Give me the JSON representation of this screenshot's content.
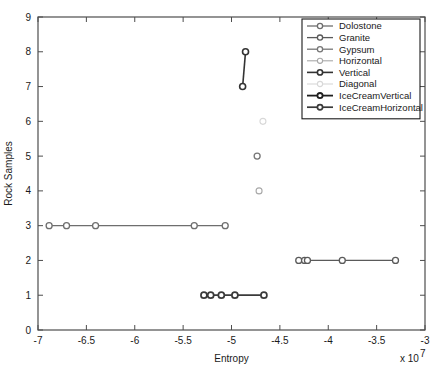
{
  "chart_data": {
    "type": "scatter",
    "title": "",
    "xlabel": "Entropy",
    "ylabel": "Rock Samples",
    "x_exponent_label": "x 10",
    "x_exponent_value": "7",
    "xlim": [
      -7,
      -3
    ],
    "ylim": [
      0,
      9
    ],
    "xticks": [
      -7,
      -6.5,
      -6,
      -5.5,
      -5,
      -4.5,
      -4,
      -3.5,
      -3
    ],
    "xticklabels": [
      "-7",
      "-6.5",
      "-6",
      "-5.5",
      "-5",
      "-4.5",
      "-4",
      "-3.5",
      "-3"
    ],
    "yticks": [
      0,
      1,
      2,
      3,
      4,
      5,
      6,
      7,
      8,
      9
    ],
    "yticklabels": [
      "0",
      "1",
      "2",
      "3",
      "4",
      "5",
      "6",
      "7",
      "8",
      "9"
    ],
    "grid": false,
    "legend_position": "upper-right",
    "series": [
      {
        "name": "Dolostone",
        "color": "#6e6e6e",
        "linewidth": 1.3,
        "marker": "o",
        "points": [
          {
            "x": -6.885,
            "y": 3
          },
          {
            "x": -6.705,
            "y": 3
          },
          {
            "x": -6.405,
            "y": 3
          },
          {
            "x": -5.385,
            "y": 3
          },
          {
            "x": -5.065,
            "y": 3
          }
        ]
      },
      {
        "name": "Granite",
        "color": "#5a5a5a",
        "linewidth": 1.3,
        "marker": "o",
        "points": [
          {
            "x": -4.305,
            "y": 2
          },
          {
            "x": -4.245,
            "y": 2
          },
          {
            "x": -4.215,
            "y": 2
          },
          {
            "x": -3.855,
            "y": 2
          },
          {
            "x": -3.305,
            "y": 2
          }
        ]
      },
      {
        "name": "Gypsum",
        "color": "#767676",
        "linewidth": 1.3,
        "marker": "o",
        "points": [
          {
            "x": -4.735,
            "y": 5
          }
        ]
      },
      {
        "name": "Horizontal",
        "color": "#a8a8a8",
        "linewidth": 1.1,
        "marker": "o",
        "points": [
          {
            "x": -4.715,
            "y": 4
          }
        ]
      },
      {
        "name": "Vertical",
        "color": "#333333",
        "linewidth": 1.6,
        "marker": "o",
        "points": [
          {
            "x": -4.855,
            "y": 8
          },
          {
            "x": -4.885,
            "y": 7
          }
        ]
      },
      {
        "name": "Diagonal",
        "color": "#d8d8d8",
        "linewidth": 1.1,
        "marker": "o",
        "points": [
          {
            "x": -4.675,
            "y": 6
          }
        ]
      },
      {
        "name": "IceCreamVertical",
        "color": "#1f1f1f",
        "linewidth": 1.8,
        "marker": "o",
        "points": []
      },
      {
        "name": "IceCreamHorizontal",
        "color": "#3a3a3a",
        "linewidth": 1.7,
        "marker": "o",
        "points": [
          {
            "x": -5.285,
            "y": 1
          },
          {
            "x": -5.215,
            "y": 1
          },
          {
            "x": -5.105,
            "y": 1
          },
          {
            "x": -4.965,
            "y": 1
          },
          {
            "x": -4.665,
            "y": 1
          }
        ]
      }
    ]
  },
  "legend": {
    "entries": [
      {
        "label": "Dolostone"
      },
      {
        "label": "Granite"
      },
      {
        "label": "Gypsum"
      },
      {
        "label": "Horizontal"
      },
      {
        "label": "Vertical"
      },
      {
        "label": "Diagonal"
      },
      {
        "label": "IceCreamVertical"
      },
      {
        "label": "IceCreamHorizontal"
      }
    ]
  },
  "colors": {
    "frame": "#4d4d4d",
    "text": "#1a1a1a",
    "background": "#ffffff"
  }
}
